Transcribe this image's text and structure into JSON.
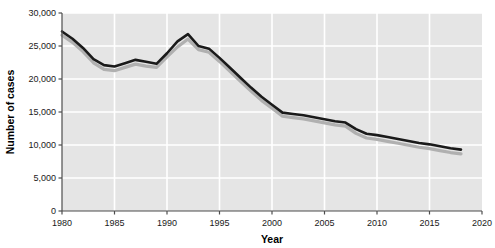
{
  "chart_data": {
    "type": "line",
    "title": "",
    "xlabel": "Year",
    "ylabel": "Number of cases",
    "xlim": [
      1980,
      2020
    ],
    "ylim": [
      0,
      30000
    ],
    "grid": true,
    "legend": "none",
    "xticks": [
      1980,
      1985,
      1990,
      1995,
      2000,
      2005,
      2010,
      2015,
      2020
    ],
    "xtick_labels": [
      "1980",
      "1985",
      "1990",
      "1995",
      "2000",
      "2005",
      "2010",
      "2015",
      "2020"
    ],
    "yticks": [
      0,
      5000,
      10000,
      15000,
      20000,
      25000,
      30000
    ],
    "ytick_labels": [
      "0",
      "5,000",
      "10,000",
      "15,000",
      "20,000",
      "25,000",
      "30,000"
    ],
    "x": [
      1980,
      1981,
      1982,
      1983,
      1984,
      1985,
      1986,
      1987,
      1988,
      1989,
      1990,
      1991,
      1992,
      1993,
      1994,
      1995,
      1996,
      1997,
      1998,
      1999,
      2000,
      2001,
      2002,
      2003,
      2004,
      2005,
      2006,
      2007,
      2008,
      2009,
      2010,
      2011,
      2012,
      2013,
      2014,
      2015,
      2016,
      2017,
      2018
    ],
    "series": [
      {
        "name": "dark-line",
        "color": "#1a1a1a",
        "values": [
          27200,
          26100,
          24700,
          23000,
          22100,
          21900,
          22400,
          22900,
          22600,
          22300,
          23900,
          25700,
          26800,
          25000,
          24600,
          23200,
          21700,
          20200,
          18700,
          17300,
          16100,
          14900,
          14700,
          14500,
          14200,
          13900,
          13600,
          13400,
          12400,
          11700,
          11500,
          11200,
          10900,
          10600,
          10300,
          10100,
          9800,
          9500,
          9300
        ]
      },
      {
        "name": "light-shadow-line",
        "color": "#b0b0b0",
        "values": [
          26900,
          25800,
          24400,
          22700,
          21700,
          21500,
          22000,
          22500,
          22200,
          22000,
          23600,
          25100,
          26300,
          24700,
          24300,
          22900,
          21400,
          19900,
          18400,
          17000,
          15800,
          14600,
          14400,
          14200,
          13900,
          13600,
          13300,
          13100,
          12000,
          11300,
          11100,
          10800,
          10500,
          10200,
          9900,
          9700,
          9400,
          9100,
          8900
        ]
      }
    ]
  },
  "panel": {
    "background_color": "#e5e5e5",
    "gridline_color": "#ffffff",
    "axis_color": "#4d4d4d"
  }
}
